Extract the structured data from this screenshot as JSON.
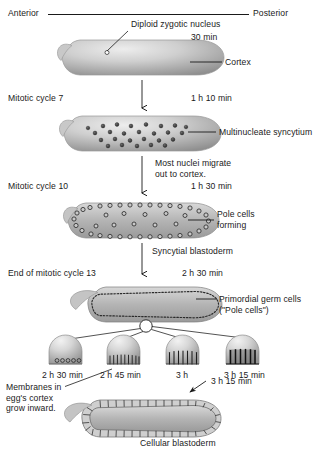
{
  "figure": {
    "axis": {
      "anterior": "Anterior",
      "posterior": "Posterior"
    },
    "colors": {
      "embryo_light": "#e4e4e4",
      "embryo_mid": "#b9b9b9",
      "embryo_dark": "#8e8e8e",
      "nucleus": "#3a3a3a",
      "line": "#1a1a1a",
      "text": "#1a1a1a"
    },
    "stages": [
      {
        "id": "stage-1-zygote",
        "stage_label": "",
        "time": "30 min",
        "callouts": [
          {
            "name": "diploid-zygotic-nucleus",
            "text": "Diploid zygotic nucleus"
          },
          {
            "name": "cortex",
            "text": "Cortex"
          }
        ]
      },
      {
        "id": "stage-2-syncytium",
        "stage_label": "Mitotic cycle 7",
        "time": "1 h 10 min",
        "callouts": [
          {
            "name": "multinucleate-syncytium",
            "text": "Multinucleate syncytium"
          }
        ]
      },
      {
        "id": "stage-3-pole-cells",
        "stage_label": "Mitotic cycle 10",
        "time": "1 h 30 min",
        "transition_note": "Most nuclei migrate\nout to cortex.",
        "callouts": [
          {
            "name": "pole-cells-forming",
            "text": "Pole cells\nforming"
          }
        ]
      },
      {
        "id": "stage-4-syncytial-blastoderm",
        "stage_label": "End of mitotic cycle 13",
        "time": "2 h 30 min",
        "transition_note": "Syncytial blastoderm",
        "callouts": [
          {
            "name": "primordial-germ-cells",
            "text": "Primordial germ cells\n(\"Pole cells\")"
          }
        ]
      },
      {
        "id": "stage-5-cellular-blastoderm",
        "stage_label": "",
        "time": "3 h 15 min",
        "callouts": [
          {
            "name": "cellular-blastoderm",
            "text": "Cellular blastoderm"
          },
          {
            "name": "membranes-grow-inward",
            "text": "Membranes in\negg's cortex\ngrow inward."
          }
        ]
      }
    ],
    "insets": [
      {
        "id": "inset-1",
        "time": "2 h 30 min",
        "furrows": 5,
        "furrow_depth": 0
      },
      {
        "id": "inset-2",
        "time": "2 h 45 min",
        "furrows": 9,
        "furrow_depth": 1
      },
      {
        "id": "inset-3",
        "time": "3 h",
        "furrows": 7,
        "furrow_depth": 2
      },
      {
        "id": "inset-4",
        "time": "3 h 15 min",
        "furrows": 6,
        "furrow_depth": 3
      }
    ]
  }
}
